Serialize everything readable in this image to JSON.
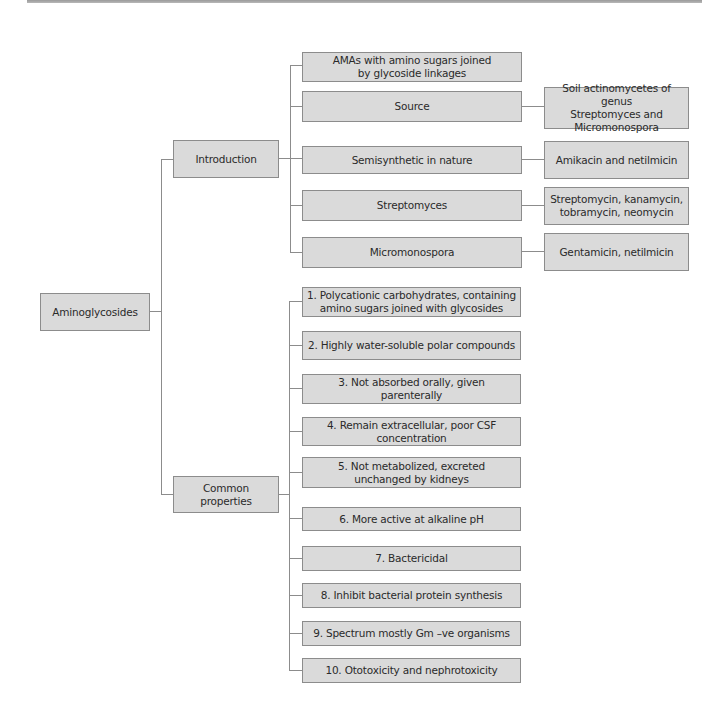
{
  "diagram": {
    "root": "Aminoglycosides",
    "branches": [
      {
        "label": "Introduction",
        "children": [
          {
            "label": "AMAs with amino sugars joined\nby glycoside linkages",
            "detail": null
          },
          {
            "label": "Source",
            "detail": "Soil actinomycetes of genus\nStreptomyces and\nMicromonospora"
          },
          {
            "label": "Semisynthetic in nature",
            "detail": "Amikacin and netilmicin"
          },
          {
            "label": "Streptomyces",
            "detail": "Streptomycin, kanamycin,\ntobramycin, neomycin"
          },
          {
            "label": "Micromonospora",
            "detail": "Gentamicin, netilmicin"
          }
        ]
      },
      {
        "label": "Common properties",
        "children": [
          {
            "label": "1. Polycationic carbohydrates, containing\namino sugars joined with glycosides"
          },
          {
            "label": "2. Highly water-soluble polar compounds"
          },
          {
            "label": "3. Not absorbed orally, given parenterally"
          },
          {
            "label": "4. Remain extracellular, poor CSF concentration"
          },
          {
            "label": "5. Not metabolized, excreted\nunchanged by kidneys"
          },
          {
            "label": "6. More active at alkaline pH"
          },
          {
            "label": "7. Bactericidal"
          },
          {
            "label": "8. Inhibit bacterial protein synthesis"
          },
          {
            "label": "9. Spectrum mostly Gm –ve organisms"
          },
          {
            "label": "10. Ototoxicity and nephrotoxicity"
          }
        ]
      }
    ]
  },
  "colors": {
    "box_fill": "#dadada",
    "box_border": "#8c8c8c",
    "connector": "#8c8c8c",
    "text": "#2a2a2a"
  }
}
